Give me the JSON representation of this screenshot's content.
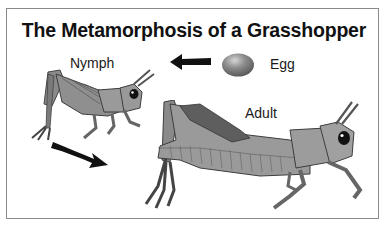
{
  "title": "The Metamorphosis of a Grasshopper",
  "stages": {
    "egg": {
      "label": "Egg"
    },
    "nymph": {
      "label": "Nymph"
    },
    "adult": {
      "label": "Adult"
    }
  },
  "arrows": [
    {
      "from": "egg",
      "to": "nymph",
      "direction": "left"
    },
    {
      "from": "nymph",
      "to": "adult",
      "direction": "down-right"
    }
  ],
  "colors": {
    "border": "#8a8a8a",
    "text": "#111111",
    "arrow": "#111111",
    "egg": "#8c8c8c",
    "body": "#8f8f8f",
    "body_dark": "#5e5e5e"
  }
}
